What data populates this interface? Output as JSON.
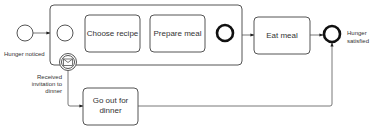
{
  "diagram": {
    "type": "BPMN process",
    "events": {
      "start": {
        "label": "Hunger noticed",
        "kind": "start"
      },
      "inner_start": {
        "label": "",
        "kind": "start"
      },
      "inner_end": {
        "label": "",
        "kind": "end"
      },
      "end": {
        "label_line1": "Hunger",
        "label_line2": "satisfied",
        "kind": "end"
      },
      "boundary": {
        "label_line1": "Received",
        "label_line2": "invitation to",
        "label_line3": "dinner",
        "kind": "boundary-message-interrupting"
      }
    },
    "tasks": {
      "choose_recipe": {
        "label": "Choose recipe"
      },
      "prepare_meal": {
        "label": "Prepare meal"
      },
      "eat_meal": {
        "label": "Eat meal"
      },
      "go_out": {
        "label_line1": "Go out for",
        "label_line2": "dinner"
      }
    },
    "subprocess": {
      "label": ""
    },
    "flows": [
      {
        "from": "start",
        "to": "subprocess"
      },
      {
        "from": "inner_start",
        "to": "choose_recipe"
      },
      {
        "from": "choose_recipe",
        "to": "prepare_meal"
      },
      {
        "from": "prepare_meal",
        "to": "inner_end"
      },
      {
        "from": "subprocess",
        "to": "eat_meal"
      },
      {
        "from": "eat_meal",
        "to": "end"
      },
      {
        "from": "boundary",
        "to": "go_out"
      },
      {
        "from": "go_out",
        "to": "end"
      }
    ]
  }
}
